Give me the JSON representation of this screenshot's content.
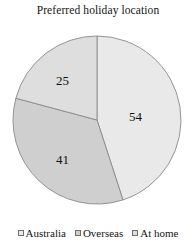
{
  "chart_data": {
    "type": "pie",
    "title": "Preferred holiday location",
    "categories": [
      "Australia",
      "Overseas",
      "At home"
    ],
    "values": [
      54,
      41,
      25
    ],
    "labels": [
      "54",
      "41",
      "25"
    ],
    "total": 120,
    "legend_position": "bottom",
    "start_angle_deg": 0,
    "direction": "clockwise",
    "slice_colors": [
      "#e9e9e9",
      "#cfcfcf",
      "#dedede"
    ],
    "slice_order_from_top_clockwise": [
      "Australia",
      "Overseas",
      "At home"
    ],
    "outline_color": "#8a8a8a",
    "xlabel": "",
    "ylabel": "",
    "grid": false
  },
  "legend": {
    "items": [
      {
        "label": "Australia",
        "color": "#e9e9e9",
        "swatch": "open-square-icon"
      },
      {
        "label": "Overseas",
        "color": "#cfcfcf",
        "swatch": "filled-square-icon"
      },
      {
        "label": "At home",
        "color": "#dedede",
        "swatch": "open-square-icon"
      }
    ]
  }
}
